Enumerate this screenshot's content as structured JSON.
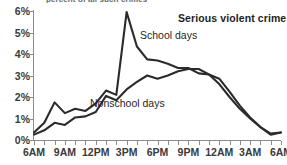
{
  "cropped_title": "percent of all such crimes",
  "annotations": {
    "series_title": "Serious violent crime",
    "school_label": "School days",
    "nonschool_label": "Nonschool days"
  },
  "chart_data": {
    "type": "line",
    "title": "Serious violent crime",
    "xlabel": "",
    "ylabel": "",
    "ylim": [
      0,
      6
    ],
    "ytick_labels": [
      "0%",
      "1%",
      "2%",
      "3%",
      "4%",
      "5%",
      "6%"
    ],
    "ytick_values": [
      0,
      1,
      2,
      3,
      4,
      5,
      6
    ],
    "grid": false,
    "legend_position": "inline-annotations",
    "x": [
      "6AM",
      "7AM",
      "8AM",
      "9AM",
      "10AM",
      "11AM",
      "12PM",
      "1PM",
      "2PM",
      "3PM",
      "4PM",
      "5PM",
      "6PM",
      "7PM",
      "8PM",
      "9PM",
      "10PM",
      "11PM",
      "12AM",
      "1AM",
      "2AM",
      "3AM",
      "4AM",
      "5AM",
      "6AM"
    ],
    "xtick_labels": [
      "6AM",
      "9AM",
      "12PM",
      "3PM",
      "6PM",
      "9PM",
      "12AM",
      "3AM",
      "6AM"
    ],
    "xtick_label_positions": [
      0,
      3,
      6,
      9,
      12,
      15,
      18,
      21,
      24
    ],
    "series": [
      {
        "name": "School days",
        "values": [
          0.35,
          0.8,
          1.75,
          1.25,
          1.45,
          1.35,
          1.7,
          2.3,
          2.1,
          5.95,
          4.35,
          3.75,
          3.7,
          3.55,
          3.35,
          3.35,
          3.1,
          3.05,
          2.85,
          2.25,
          1.6,
          1.05,
          0.6,
          0.25,
          0.35
        ]
      },
      {
        "name": "Nonschool days",
        "values": [
          0.25,
          0.45,
          0.8,
          0.7,
          1.05,
          1.1,
          1.3,
          2.05,
          1.85,
          2.35,
          2.7,
          3.0,
          2.85,
          3.0,
          3.2,
          3.3,
          3.3,
          3.05,
          2.6,
          2.0,
          1.45,
          1.0,
          0.6,
          0.3,
          0.35
        ]
      }
    ]
  }
}
